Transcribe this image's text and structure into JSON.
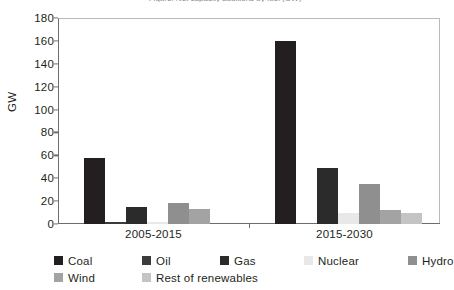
{
  "chart_data": {
    "type": "bar",
    "title": "Figure: Net capacity additions by fuel (GW)",
    "xlabel": "",
    "ylabel": "GW",
    "ylim": [
      0,
      180
    ],
    "ytick_step": 20,
    "yticks": [
      180,
      160,
      140,
      120,
      100,
      80,
      60,
      40,
      20,
      0
    ],
    "grid": false,
    "legend_position": "bottom",
    "categories": [
      "2005-2015",
      "2015-2030"
    ],
    "series": [
      {
        "name": "Coal",
        "color": "#231f20",
        "values": [
          58,
          160
        ]
      },
      {
        "name": "Oil",
        "color": "#3b3b3b",
        "values": [
          1.5,
          0
        ]
      },
      {
        "name": "Gas",
        "color": "#2b2b2b",
        "values": [
          14.5,
          49
        ]
      },
      {
        "name": "Nuclear",
        "color": "#e8e8e8",
        "values": [
          2,
          10
        ]
      },
      {
        "name": "Hydro",
        "color": "#8f8f8f",
        "values": [
          18,
          35
        ]
      },
      {
        "name": "Wind",
        "color": "#a3a3a3",
        "values": [
          13,
          12
        ]
      },
      {
        "name": "Rest of renewables",
        "color": "#c4c4c4",
        "values": [
          0,
          10
        ]
      }
    ]
  }
}
